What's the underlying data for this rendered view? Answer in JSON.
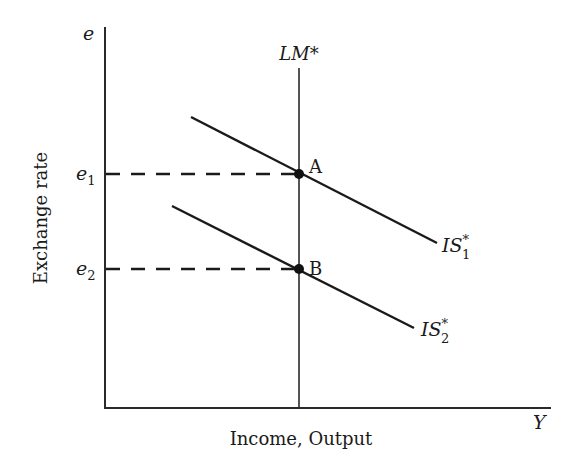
{
  "diagram": {
    "type": "IS-LM (Mundell-Fleming) diagram",
    "y_axis": {
      "symbol": "e",
      "label": "Exchange rate"
    },
    "x_axis": {
      "symbol": "Y",
      "label": "Income, Output"
    },
    "curves": {
      "lm": {
        "label": "LM*"
      },
      "is1": {
        "label": "IS",
        "sub": "1",
        "sup": "*"
      },
      "is2": {
        "label": "IS",
        "sub": "2",
        "sup": "*"
      }
    },
    "points": {
      "a": {
        "label": "A",
        "level_label": "e",
        "level_sub": "1"
      },
      "b": {
        "label": "B",
        "level_label": "e",
        "level_sub": "2"
      }
    },
    "color": "#1a1a1a"
  }
}
